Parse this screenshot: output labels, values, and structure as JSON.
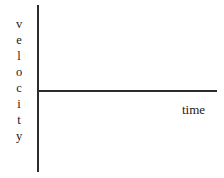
{
  "figure": {
    "type": "velocity-time-graph",
    "background_color": "#ffffff",
    "axis_color": "#2b2b2b",
    "text_color": "#1b1b1b",
    "y_axis": {
      "label": "velocity",
      "label_orientation": "stacked-vertical",
      "letters": [
        "v",
        "e",
        "l",
        "o",
        "c",
        "i",
        "t",
        "y"
      ]
    },
    "x_axis": {
      "label": "time"
    },
    "series": [
      {
        "name": "velocity",
        "description": "horizontal line at constant velocity",
        "points": [
          [
            0,
            0
          ],
          [
            1,
            0
          ]
        ]
      }
    ]
  },
  "chart_data": {
    "type": "line",
    "title": "",
    "xlabel": "time",
    "ylabel": "velocity",
    "xlim": [
      0,
      1
    ],
    "ylim": [
      -1,
      1
    ],
    "grid": false,
    "legend": "none",
    "tick_labels": {
      "x": [],
      "y": []
    },
    "series": [
      {
        "name": "velocity",
        "x": [
          0,
          1
        ],
        "values": [
          0,
          0
        ]
      }
    ],
    "annotations": []
  }
}
